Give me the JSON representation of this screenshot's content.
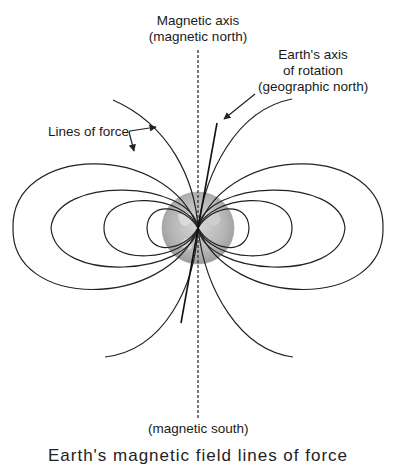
{
  "labels": {
    "magnetic_axis_line1": "Magnetic axis",
    "magnetic_axis_line2": "(magnetic north)",
    "rotation_axis_line1": "Earth's axis",
    "rotation_axis_line2": "of rotation",
    "rotation_axis_line3": "(geographic north)",
    "lines_of_force": "Lines of force",
    "magnetic_south": "(magnetic south)"
  },
  "caption_cropped": "Earth's magnetic field lines of force",
  "colors": {
    "line": "#222222",
    "globe": "#b8b8b8",
    "background": "#ffffff"
  }
}
